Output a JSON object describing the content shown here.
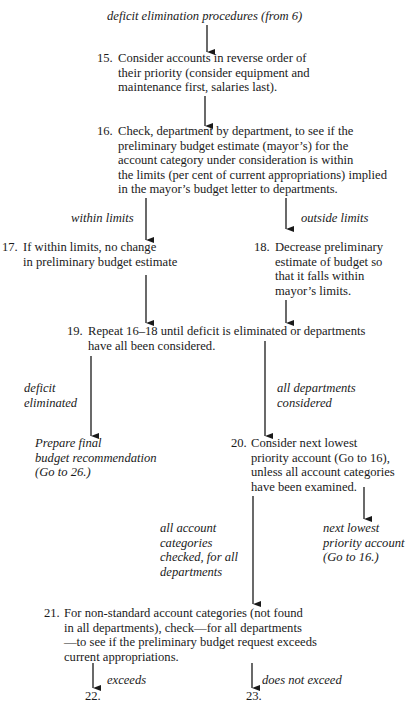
{
  "title": "deficit elimination procedures (from 6)",
  "steps": {
    "s15": {
      "num": "15.",
      "lines": [
        "Consider accounts in reverse order of",
        "their priority (consider equipment and",
        "maintenance first, salaries last)."
      ]
    },
    "s16": {
      "num": "16.",
      "lines": [
        "Check, department by department, to see if the",
        "preliminary budget estimate (mayor’s) for the",
        "account category under consideration is within",
        "the limits (per cent of current appropriations) implied",
        "in the mayor’s budget letter to departments."
      ]
    },
    "s17": {
      "num": "17.",
      "lines": [
        "If within limits, no change",
        "in preliminary budget estimate"
      ]
    },
    "s18": {
      "num": "18.",
      "lines": [
        "Decrease preliminary",
        "estimate of budget so",
        "that it falls within",
        "mayor’s limits."
      ]
    },
    "s19": {
      "num": "19.",
      "lines": [
        "Repeat 16–18 until deficit is eliminated or departments",
        "have all been considered."
      ]
    },
    "s20": {
      "num": "20.",
      "lines": [
        "Consider next lowest",
        "priority account (Go to 16),",
        "unless all account categories",
        "have been examined."
      ]
    },
    "s21": {
      "num": "21.",
      "lines": [
        "For non-standard account categories (not found",
        "in all departments), check—for all departments",
        "—to see if the preliminary budget request exceeds",
        "current appropriations."
      ]
    }
  },
  "labels": {
    "within_limits": [
      "within limits"
    ],
    "outside_limits": [
      "outside limits"
    ],
    "deficit_eliminated": [
      "deficit",
      "eliminated"
    ],
    "all_departments": [
      "all departments",
      "considered"
    ],
    "prepare_final": [
      "Prepare final",
      "budget recommendation",
      "(Go to 26.)"
    ],
    "next_lowest": [
      "next lowest",
      "priority account",
      "(Go to 16.)"
    ],
    "all_categories": [
      "all account",
      "categories",
      "checked, for all",
      "departments"
    ],
    "exceeds": [
      "exceeds"
    ],
    "does_not_exceed": [
      "does not exceed"
    ]
  },
  "terminals": {
    "t22": "22.",
    "t23": "23."
  },
  "colors": {
    "ink": "#1a1a1a",
    "background": "#ffffff"
  }
}
